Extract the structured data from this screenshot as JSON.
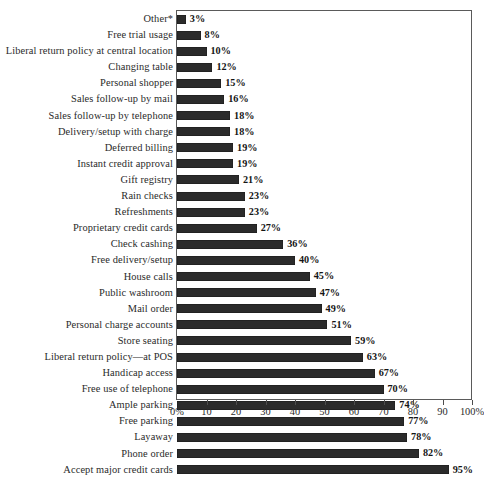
{
  "chart_data": {
    "type": "bar",
    "orientation": "horizontal",
    "title": "",
    "subtitle": "",
    "xlabel": "",
    "ylabel": "",
    "xlim": [
      0,
      100
    ],
    "grid": false,
    "legend": null,
    "value_suffix": "%",
    "categories": [
      "Other*",
      "Free trial usage",
      "Liberal return policy at central location",
      "Changing table",
      "Personal shopper",
      "Sales follow-up by mail",
      "Sales follow-up by telephone",
      "Delivery/setup with charge",
      "Deferred billing",
      "Instant credit approval",
      "Gift registry",
      "Rain checks",
      "Refreshments",
      "Proprietary credit cards",
      "Check cashing",
      "Free delivery/setup",
      "House calls",
      "Public washroom",
      "Mail order",
      "Personal charge accounts",
      "Store seating",
      "Liberal return policy—at POS",
      "Handicap access",
      "Free use of telephone",
      "Ample parking",
      "Free parking",
      "Layaway",
      "Phone order",
      "Accept major credit cards"
    ],
    "values": [
      3,
      8,
      10,
      12,
      15,
      16,
      18,
      18,
      19,
      19,
      21,
      23,
      23,
      27,
      36,
      40,
      45,
      47,
      49,
      51,
      59,
      63,
      67,
      70,
      74,
      77,
      78,
      82,
      95
    ],
    "value_labels": [
      "3%",
      "8%",
      "10%",
      "12%",
      "15%",
      "16%",
      "18%",
      "18%",
      "19%",
      "19%",
      "21%",
      "23%",
      "23%",
      "27%",
      "36%",
      "40%",
      "45%",
      "47%",
      "49%",
      "51%",
      "59%",
      "63%",
      "67%",
      "70%",
      "74%",
      "77%",
      "78%",
      "82%",
      "95%"
    ],
    "xticks": [
      0,
      10,
      20,
      30,
      40,
      50,
      60,
      70,
      80,
      90,
      100
    ],
    "xtick_labels": [
      "0%",
      "10",
      "20",
      "30",
      "40",
      "50",
      "60",
      "70",
      "80",
      "90",
      "100%"
    ],
    "bar_color": "#2b2b2b"
  }
}
